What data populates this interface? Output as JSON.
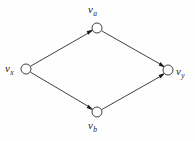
{
  "figure": {
    "type": "directed-graph",
    "title": "",
    "background_color": "#fefefe",
    "stroke_color": "#2b2b2b",
    "node_fill_color": "#ffffff",
    "label_color": "#1a1a1a",
    "width": 195,
    "height": 141
  },
  "nodes": [
    {
      "id": "va",
      "base": "v",
      "sub": "a",
      "label": "v",
      "subscript": "a",
      "x": 97,
      "y": 28,
      "r": 5
    },
    {
      "id": "vx",
      "base": "v",
      "sub": "x",
      "label": "v",
      "subscript": "x",
      "x": 26,
      "y": 69,
      "r": 5
    },
    {
      "id": "vy",
      "base": "v",
      "sub": "y",
      "label": "v",
      "subscript": "y",
      "x": 168,
      "y": 70,
      "r": 5
    },
    {
      "id": "vb",
      "base": "v",
      "sub": "b",
      "label": "v",
      "subscript": "b",
      "x": 97,
      "y": 112,
      "r": 5
    }
  ],
  "edges": [
    {
      "id": "vx-va",
      "from": "vx",
      "to": "va",
      "directed": true,
      "arrow_at": "va"
    },
    {
      "id": "vx-vb",
      "from": "vx",
      "to": "vb",
      "directed": true,
      "arrow_at": "vb"
    },
    {
      "id": "va-vy",
      "from": "va",
      "to": "vy",
      "directed": true,
      "arrow_at": "vy"
    },
    {
      "id": "vb-vy",
      "from": "vb",
      "to": "vy",
      "directed": true,
      "arrow_at": "vy"
    }
  ]
}
